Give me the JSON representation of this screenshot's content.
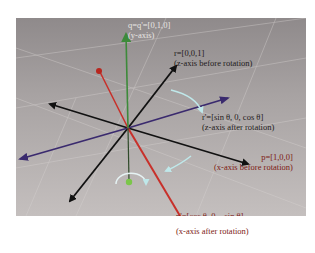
{
  "diagram": {
    "labels": {
      "q": {
        "main": "q=q'=[0,1,0]",
        "sub": "(y-axis)"
      },
      "r": {
        "main": "r=[0,0,1]",
        "sub": "(z-axis before rotation)"
      },
      "r_prime": {
        "main": "r'=[sin θ, 0, cos θ]",
        "sub": "(z-axis after rotation)"
      },
      "p": {
        "main": "p=[1,0,0]",
        "sub": "(x-axis before rotation)"
      },
      "p_prime": {
        "main": "p'=[cos θ, 0, −sin θ]",
        "sub": "(x-axis after rotation)"
      }
    },
    "colors": {
      "background": "#a8a3a3",
      "y_axis": "#3d8a3a",
      "z_axis_before": "#c8302a",
      "z_axis_after": "#3a2a6e",
      "x_axis": "#111111",
      "x_axis_after": "#b8261e",
      "rotation_arrow": "#bfe8ea"
    }
  }
}
